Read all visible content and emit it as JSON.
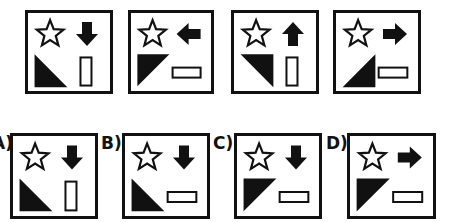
{
  "puzzle": {
    "sequence": [
      {
        "id": "q1",
        "x": 25,
        "y": 10,
        "w": 88,
        "h": 84,
        "arrow": "down",
        "triangle": "bottom-left",
        "rect": "vertical"
      },
      {
        "id": "q2",
        "x": 128,
        "y": 10,
        "w": 86,
        "h": 84,
        "arrow": "left",
        "triangle": "top-left",
        "rect": "horizontal"
      },
      {
        "id": "q3",
        "x": 231,
        "y": 10,
        "w": 88,
        "h": 84,
        "arrow": "up",
        "triangle": "top-right",
        "rect": "vertical"
      },
      {
        "id": "q4",
        "x": 333,
        "y": 10,
        "w": 88,
        "h": 84,
        "arrow": "right",
        "triangle": "bottom-right",
        "rect": "horizontal"
      }
    ],
    "options": [
      {
        "label": "A)",
        "label_x": -8,
        "x": 10,
        "y": 133,
        "w": 88,
        "h": 86,
        "arrow": "down",
        "triangle": "bottom-left",
        "rect": "vertical"
      },
      {
        "label": "B)",
        "label_x": 101,
        "x": 122,
        "y": 133,
        "w": 88,
        "h": 86,
        "arrow": "down",
        "triangle": "bottom-left",
        "rect": "horizontal"
      },
      {
        "label": "C)",
        "label_x": 213,
        "x": 234,
        "y": 133,
        "w": 88,
        "h": 86,
        "arrow": "down",
        "triangle": "top-left",
        "rect": "horizontal"
      },
      {
        "label": "D)",
        "label_x": 326,
        "x": 347,
        "y": 133,
        "w": 89,
        "h": 86,
        "arrow": "right",
        "triangle": "top-left",
        "rect": "horizontal"
      }
    ],
    "colors": {
      "stroke": "#111111",
      "fill": "#111111",
      "background": "#ffffff"
    }
  }
}
